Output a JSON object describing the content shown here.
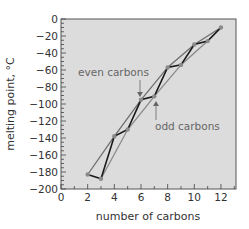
{
  "chart_data": {
    "type": "line",
    "title": "",
    "xlabel": "number of carbons",
    "ylabel": "melting point, °C",
    "xlim": [
      0,
      13
    ],
    "ylim": [
      -200,
      0
    ],
    "xticks": [
      0,
      2,
      4,
      6,
      8,
      10,
      12
    ],
    "yticks": [
      0,
      -20,
      -40,
      -60,
      -80,
      -100,
      -120,
      -140,
      -160,
      -180,
      -200
    ],
    "grid": false,
    "series": [
      {
        "name": "melting point (all alkanes)",
        "x": [
          2,
          3,
          4,
          5,
          6,
          7,
          8,
          9,
          10,
          11,
          12
        ],
        "values": [
          -183,
          -188,
          -138,
          -130,
          -95,
          -91,
          -57,
          -54,
          -30,
          -26,
          -10
        ],
        "color": "#1a1a1a"
      },
      {
        "name": "even carbons",
        "x": [
          2,
          4,
          6,
          8,
          10,
          12
        ],
        "values": [
          -183,
          -138,
          -95,
          -57,
          -30,
          -10
        ],
        "color": "#6e6e6e"
      },
      {
        "name": "odd carbons",
        "x": [
          3,
          5,
          7,
          9,
          11,
          12
        ],
        "values": [
          -188,
          -130,
          -91,
          -54,
          -26,
          -10
        ],
        "color": "#8a8a8a"
      }
    ],
    "annotations": [
      {
        "text": "even carbons",
        "x": 5.3,
        "y": -62,
        "arrow_to": [
          6.0,
          -93
        ]
      },
      {
        "text": "odd carbons",
        "x": 6.7,
        "y": -120,
        "arrow_to": [
          7.0,
          -93
        ]
      }
    ],
    "colors": {
      "plot_bg": "#dcdcdc",
      "frame": "#555555",
      "data_line": "#1a1a1a",
      "fit_line": "#777777",
      "marker": "#888888"
    }
  },
  "labels": {
    "xlabel": "number of carbons",
    "ylabel": "melting point, °C",
    "even": "even carbons",
    "odd": "odd carbons"
  }
}
